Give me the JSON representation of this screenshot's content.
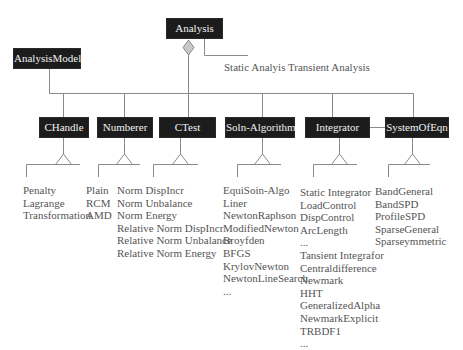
{
  "diagram": {
    "root": {
      "label": "Analysis"
    },
    "root_note": "Static Analyis Transient Analysis",
    "model": {
      "label": "AnalysisModel"
    },
    "components": [
      {
        "id": "chandle",
        "label": "CHandle",
        "items": [
          "Penalty",
          "Lagrange",
          "Transformation"
        ]
      },
      {
        "id": "numberer",
        "label": "Numberer",
        "items": [
          "Plain",
          "RCM",
          "AMD"
        ]
      },
      {
        "id": "ctest",
        "label": "CTest",
        "items": [
          "Norm DispIncr",
          "Norm Unbalance",
          "Norm Energy",
          "Relative Norm DispIncr",
          "Relative Norm Unbalance",
          "Relative Norm Energy"
        ]
      },
      {
        "id": "soln-algorithm",
        "label": "Soln-Algorithm",
        "items": [
          "EquiSoin-Algo",
          "Liner",
          "NewtonRaphson",
          "ModifiedNewton",
          "Broyfden",
          "BFGS",
          "KrylovNewton",
          "NewtonLineSearch",
          "..."
        ]
      },
      {
        "id": "integrator",
        "label": "Integrator",
        "items": [
          "Static Integrator",
          "LoadControl",
          "DispControl",
          "ArcLength",
          "...",
          "Tansient Integrafor",
          "Centraldifference",
          "Newmark",
          "HHT",
          "GeneralizedAlpha",
          "NewmarkExplicit",
          "TRBDF1",
          "..."
        ]
      },
      {
        "id": "system-of-eqn",
        "label": "SystemOfEqn",
        "items": [
          "BandGeneral",
          "BandSPD",
          "ProfileSPD",
          "SparseGeneral",
          "Sparseymmetric"
        ]
      }
    ],
    "colors": {
      "box_fill": "#1c1c1c",
      "box_text": "#f2f2f2",
      "line": "#8a8a8a",
      "diamond": "#c8c8c8",
      "text": "#555555"
    }
  }
}
